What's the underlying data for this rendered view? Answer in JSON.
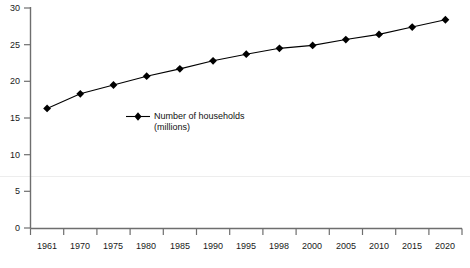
{
  "chart_data": {
    "type": "line",
    "title": "",
    "xlabel": "",
    "ylabel": "",
    "categories": [
      "1961",
      "1970",
      "1975",
      "1980",
      "1985",
      "1990",
      "1995",
      "1998",
      "2000",
      "2005",
      "2010",
      "2015",
      "2020"
    ],
    "series": [
      {
        "name": "Number of households (millions)",
        "values": [
          16.3,
          18.3,
          19.5,
          20.7,
          21.7,
          22.8,
          23.7,
          24.5,
          24.9,
          25.7,
          26.4,
          27.4,
          28.4
        ],
        "marker": "diamond",
        "color": "#000000"
      }
    ],
    "ylim": [
      0,
      30
    ],
    "yticks": [
      0,
      5,
      10,
      15,
      20,
      25,
      30
    ],
    "ytick_labels": [
      "0",
      "5",
      "10",
      "15",
      "20",
      "25",
      "30"
    ],
    "grid": false,
    "faint_gridline_value": 7,
    "legend": {
      "position": "inside-left",
      "entries": [
        {
          "label": "Number of households\n(millions)",
          "marker": "diamond",
          "color": "#000000"
        }
      ]
    },
    "axis_color": "#6e6e6e"
  }
}
